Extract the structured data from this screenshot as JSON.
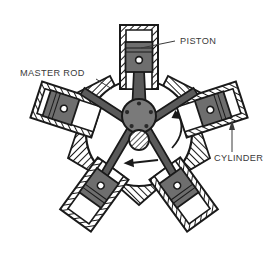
{
  "figure": {
    "name": "radial-engine-cutaway-diagram",
    "width": 275,
    "height": 262,
    "background_color": "#ffffff"
  },
  "colors": {
    "outline": "#1a1a1a",
    "hatch": "#1a1a1a",
    "piston_fill": "#6e6e6e",
    "hub_fill": "#7a7a7a",
    "chamber_fill": "#ffffff",
    "crankcase_fill": "#ffffff",
    "label_text": "#3a3a3a",
    "leader_line": "#3a3a3a",
    "rod_fill": "#5a5a5a"
  },
  "labels": [
    {
      "id": "piston",
      "text": "PISTON",
      "x": 180,
      "y": 44,
      "anchor": "start",
      "leader": {
        "type": "line",
        "x1": 175,
        "y1": 41,
        "x2": 141,
        "y2": 48
      }
    },
    {
      "id": "master-rod",
      "text": "MASTER ROD",
      "x": 20,
      "y": 76,
      "anchor": "start",
      "leader": {
        "type": "line",
        "x1": 96,
        "y1": 79,
        "x2": 112,
        "y2": 89
      }
    },
    {
      "id": "cylinder",
      "text": "CYLINDER",
      "x": 214,
      "y": 161,
      "anchor": "start",
      "leader": {
        "type": "arrow",
        "x1": 232,
        "y1": 152,
        "x2": 232,
        "y2": 122
      }
    }
  ],
  "rotation_indicator": {
    "name": "rotation-direction-arrow",
    "direction": "counterclockwise",
    "arrow_tip_x": 125,
    "arrow_tip_y": 162,
    "arrow_tail_x": 158,
    "arrow_tail_y": 160
  },
  "crankcase": {
    "name": "crankcase-housing",
    "center_x": 139,
    "center_y": 133,
    "outer_radius": 57,
    "fill": "#ffffff"
  },
  "crank_hub": {
    "name": "crankpin-hub",
    "center_x": 139,
    "center_y": 116,
    "radius": 17,
    "fill": "#7a7a7a",
    "knuckle_pin_count": 5,
    "pin_radius": 2.1
  },
  "crankshaft_journal": {
    "name": "crankshaft-journal",
    "center_x": 139,
    "center_y": 140,
    "radius": 10,
    "hatched": true
  },
  "cylinders": [
    {
      "id": "cylinder-top",
      "position": "top",
      "angle_deg": 0,
      "bore_length": 74,
      "bore_width": 30,
      "piston_offset": 26,
      "is_master": true,
      "label": "top cylinder with master rod"
    },
    {
      "id": "cylinder-upper-left",
      "position": "upper-left",
      "angle_deg": -72,
      "bore_length": 74,
      "bore_width": 30,
      "piston_offset": 42,
      "is_master": false,
      "label": "upper left cylinder"
    },
    {
      "id": "cylinder-upper-right",
      "position": "upper-right",
      "angle_deg": 72,
      "bore_length": 74,
      "bore_width": 30,
      "piston_offset": 38,
      "is_master": false,
      "label": "upper right cylinder"
    },
    {
      "id": "cylinder-lower-left",
      "position": "lower-left",
      "angle_deg": -144,
      "bore_length": 74,
      "bore_width": 30,
      "piston_offset": 24,
      "is_master": false,
      "label": "lower left cylinder"
    },
    {
      "id": "cylinder-lower-right",
      "position": "lower-right",
      "angle_deg": 144,
      "bore_length": 74,
      "bore_width": 30,
      "piston_offset": 24,
      "is_master": false,
      "label": "lower right cylinder"
    }
  ]
}
